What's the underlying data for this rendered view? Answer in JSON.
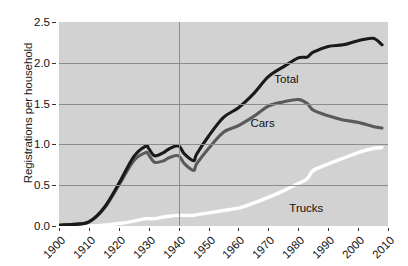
{
  "chart_data": {
    "type": "line",
    "title": "",
    "xlabel": "",
    "ylabel": "Registrations per household",
    "xlim": [
      1900,
      2010
    ],
    "ylim": [
      0.0,
      2.5
    ],
    "grid": true,
    "legend_position": "inline-annotations",
    "xticks": [
      "1900",
      "1910",
      "1920",
      "1930",
      "1940",
      "1950",
      "1960",
      "1970",
      "1980",
      "1990",
      "2000",
      "2010"
    ],
    "yticks": [
      "0.0",
      "0.5",
      "1.0",
      "1.5",
      "2.0",
      "2.5"
    ],
    "annotations": [
      {
        "text": "Total",
        "x": 1972,
        "y": 1.88
      },
      {
        "text": "Cars",
        "x": 1964,
        "y": 1.33
      },
      {
        "text": "Trucks",
        "x": 1977,
        "y": 0.29
      }
    ],
    "x": [
      1900,
      1905,
      1910,
      1915,
      1920,
      1925,
      1929,
      1930,
      1932,
      1935,
      1937,
      1940,
      1942,
      1945,
      1946,
      1950,
      1955,
      1960,
      1965,
      1970,
      1975,
      1980,
      1983,
      1985,
      1990,
      1995,
      2000,
      2005,
      2008
    ],
    "series": [
      {
        "name": "Total",
        "color": "#1a1a1a",
        "values": [
          0.01,
          0.02,
          0.05,
          0.22,
          0.52,
          0.85,
          0.98,
          0.95,
          0.86,
          0.9,
          0.95,
          0.98,
          0.88,
          0.8,
          0.88,
          1.1,
          1.33,
          1.45,
          1.62,
          1.83,
          1.95,
          2.06,
          2.07,
          2.13,
          2.2,
          2.22,
          2.27,
          2.3,
          2.22
        ]
      },
      {
        "name": "Cars",
        "color": "#5a5a5a",
        "values": [
          0.01,
          0.02,
          0.05,
          0.21,
          0.5,
          0.8,
          0.9,
          0.87,
          0.78,
          0.8,
          0.84,
          0.86,
          0.76,
          0.68,
          0.76,
          0.95,
          1.15,
          1.23,
          1.34,
          1.47,
          1.52,
          1.55,
          1.5,
          1.42,
          1.35,
          1.3,
          1.27,
          1.22,
          1.2
        ]
      },
      {
        "name": "Trucks",
        "color": "#ffffff",
        "values": [
          0.0,
          0.0,
          0.0,
          0.01,
          0.03,
          0.06,
          0.09,
          0.09,
          0.09,
          0.11,
          0.12,
          0.13,
          0.13,
          0.13,
          0.14,
          0.16,
          0.19,
          0.22,
          0.28,
          0.35,
          0.43,
          0.52,
          0.58,
          0.68,
          0.76,
          0.83,
          0.9,
          0.95,
          0.96
        ]
      }
    ]
  },
  "axes": {
    "plot_background": "#d2d2d2",
    "grid_color": "#8d8d8d",
    "frame_color": "#ffffff"
  }
}
